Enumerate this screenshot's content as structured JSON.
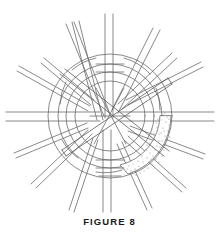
{
  "figure": {
    "caption": "FIGURE 8",
    "title": "FIGURE 8",
    "background_color": "#ffffff",
    "line_color": "#6b6b6b",
    "line_color_dark": "#4a4a4a",
    "caption_color": "#1a1a1a",
    "stipple_color": "#7a7a7a",
    "stroke_width": 0.8,
    "center": {
      "x": 110,
      "y": 116
    },
    "ring": {
      "outer_radius": 62,
      "middle_radius": 50,
      "inner_radius": 38,
      "band_width": 11,
      "stipple_arc_start_deg": 10,
      "stipple_arc_end_deg": 95,
      "stipple_dot_count": 150
    },
    "spokes": [
      {
        "name": "spoke-n",
        "angle_deg": -90,
        "width": 7,
        "length": 112,
        "over": true
      },
      {
        "name": "spoke-nne",
        "angle_deg": -72,
        "width": 6,
        "length": 108,
        "over": false
      },
      {
        "name": "spoke-ne",
        "angle_deg": -54,
        "width": 6,
        "length": 118,
        "over": true
      },
      {
        "name": "spoke-ene",
        "angle_deg": -36,
        "width": 6,
        "length": 116,
        "over": false
      },
      {
        "name": "spoke-e-up",
        "angle_deg": -20,
        "width": 5,
        "length": 110,
        "over": true
      },
      {
        "name": "spoke-e",
        "angle_deg": 0,
        "width": 8,
        "length": 112,
        "over": true
      },
      {
        "name": "spoke-ese",
        "angle_deg": 22,
        "width": 5,
        "length": 108,
        "over": false
      },
      {
        "name": "spoke-se",
        "angle_deg": 44,
        "width": 5,
        "length": 104,
        "over": false
      },
      {
        "name": "spoke-sse",
        "angle_deg": 66,
        "width": 5,
        "length": 102,
        "over": false
      },
      {
        "name": "spoke-s",
        "angle_deg": 90,
        "width": 7,
        "length": 104,
        "over": true
      },
      {
        "name": "spoke-ssw",
        "angle_deg": 112,
        "width": 6,
        "length": 104,
        "over": false
      },
      {
        "name": "spoke-sw",
        "angle_deg": 134,
        "width": 6,
        "length": 108,
        "over": false
      },
      {
        "name": "spoke-wsw",
        "angle_deg": 156,
        "width": 5,
        "length": 110,
        "over": false
      },
      {
        "name": "spoke-w",
        "angle_deg": 180,
        "width": 8,
        "length": 112,
        "over": true
      },
      {
        "name": "spoke-wnw",
        "angle_deg": 198,
        "width": 5,
        "length": 112,
        "over": false
      },
      {
        "name": "spoke-nw",
        "angle_deg": 216,
        "width": 6,
        "length": 116,
        "over": false
      },
      {
        "name": "spoke-nnw",
        "angle_deg": 250,
        "width": 6,
        "length": 112,
        "over": false
      }
    ],
    "crossing_strands": [
      {
        "name": "strand-diag-nw-se",
        "angle_deg": 28,
        "width": 9,
        "length": 150
      },
      {
        "name": "strand-diag-ne-sw",
        "angle_deg": -33,
        "width": 9,
        "length": 150
      }
    ],
    "tick_marks": {
      "name": "center-ladder-ticks",
      "count": 5,
      "orientation": "horizontal"
    }
  }
}
